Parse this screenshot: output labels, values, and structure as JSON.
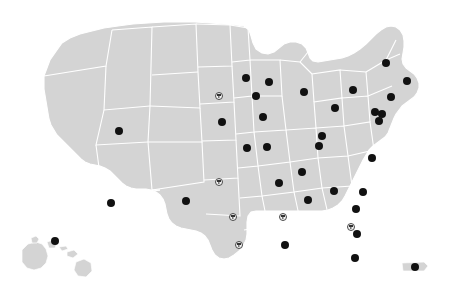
{
  "map": {
    "title": "United States location map",
    "region_label": "United States",
    "background_color": "#ffffff",
    "land_color": "#d4d4d4",
    "border_color": "#ffffff",
    "marker_filled_color": "#111111",
    "marker_open_color": "#f2f2f2",
    "marker_open_border_color": "#4a4a4a"
  },
  "legend": {
    "filled_label": "Location",
    "open_label": "Highlighted location"
  },
  "chart_data": {
    "type": "scatter",
    "xlabel": "",
    "ylabel": "",
    "xlim": [
      0,
      452
    ],
    "ylim": [
      0,
      306
    ],
    "grid": false,
    "legend_position": "none",
    "series": [
      {
        "name": "filled",
        "marker": "filled-circle",
        "color": "#111111",
        "count": 33,
        "points": [
          {
            "x": 246,
            "y": 78
          },
          {
            "x": 269,
            "y": 82
          },
          {
            "x": 256,
            "y": 96
          },
          {
            "x": 263,
            "y": 117
          },
          {
            "x": 222,
            "y": 122
          },
          {
            "x": 119,
            "y": 131
          },
          {
            "x": 304,
            "y": 92
          },
          {
            "x": 335,
            "y": 108
          },
          {
            "x": 322,
            "y": 136
          },
          {
            "x": 319,
            "y": 146
          },
          {
            "x": 386,
            "y": 63
          },
          {
            "x": 407,
            "y": 81
          },
          {
            "x": 353,
            "y": 90
          },
          {
            "x": 391,
            "y": 97
          },
          {
            "x": 375,
            "y": 112
          },
          {
            "x": 382,
            "y": 114
          },
          {
            "x": 379,
            "y": 121
          },
          {
            "x": 247,
            "y": 148
          },
          {
            "x": 267,
            "y": 147
          },
          {
            "x": 111,
            "y": 203
          },
          {
            "x": 186,
            "y": 201
          },
          {
            "x": 302,
            "y": 172
          },
          {
            "x": 372,
            "y": 158
          },
          {
            "x": 279,
            "y": 183
          },
          {
            "x": 334,
            "y": 191
          },
          {
            "x": 363,
            "y": 192
          },
          {
            "x": 308,
            "y": 200
          },
          {
            "x": 285,
            "y": 245
          },
          {
            "x": 357,
            "y": 234
          },
          {
            "x": 356,
            "y": 209
          },
          {
            "x": 355,
            "y": 258
          },
          {
            "x": 415,
            "y": 267
          },
          {
            "x": 55,
            "y": 241
          }
        ]
      },
      {
        "name": "open",
        "marker": "open-circle",
        "color": "#f2f2f2",
        "count": 5,
        "points": [
          {
            "x": 219,
            "y": 96
          },
          {
            "x": 219,
            "y": 182
          },
          {
            "x": 233,
            "y": 217
          },
          {
            "x": 239,
            "y": 245
          },
          {
            "x": 283,
            "y": 217
          },
          {
            "x": 351,
            "y": 227
          }
        ]
      }
    ]
  }
}
